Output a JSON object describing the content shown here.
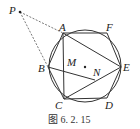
{
  "figure": {
    "caption": "图 6. 2. 15",
    "labels": {
      "P": "P",
      "A": "A",
      "F": "F",
      "E": "E",
      "D": "D",
      "C": "C",
      "B": "B",
      "M": "M",
      "N": "N"
    },
    "points": {
      "P": [
        20,
        12
      ],
      "A": [
        63,
        33
      ],
      "F": [
        107,
        33
      ],
      "E": [
        121,
        67
      ],
      "D": [
        107,
        98
      ],
      "C": [
        64,
        99
      ],
      "B": [
        48,
        67
      ],
      "O": [
        85,
        67
      ],
      "M": [
        64,
        72
      ],
      "N": [
        95,
        80
      ]
    },
    "circle": {
      "cx": 85,
      "cy": 66,
      "r": 36
    },
    "colors": {
      "stroke": "#333333",
      "dashed": "#555555"
    }
  }
}
